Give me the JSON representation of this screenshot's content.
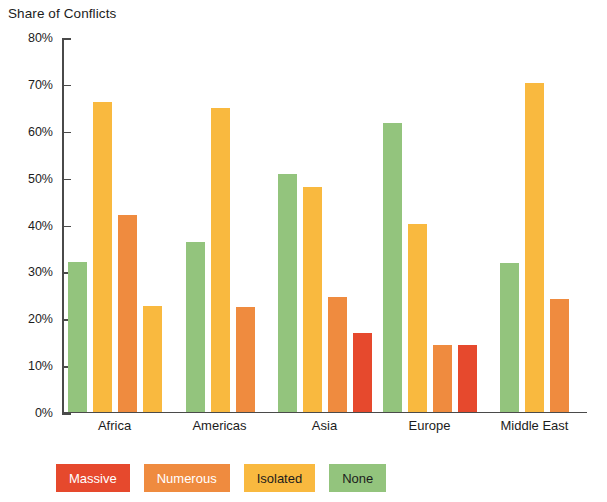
{
  "chart_data": {
    "type": "bar",
    "title": "Share of Conflicts",
    "xlabel": "",
    "ylabel": "",
    "ylim": [
      0,
      80
    ],
    "grid": false,
    "legend_position": "bottom",
    "y_tick_labels": [
      "80%",
      "70%",
      "60%",
      "50%",
      "40%",
      "30%",
      "20%",
      "10%",
      "0%"
    ],
    "y_ticks": [
      80,
      70,
      60,
      50,
      40,
      30,
      20,
      10,
      0
    ],
    "categories": [
      "Africa",
      "Americas",
      "Asia",
      "Europe",
      "Middle East"
    ],
    "series": [
      {
        "name": "None",
        "color": "#93c47d",
        "values": [
          32.0,
          36.2,
          50.6,
          61.5,
          31.7
        ]
      },
      {
        "name": "Isolated",
        "color": "#f9b93f",
        "values": [
          66.1,
          64.8,
          48.0,
          40.0,
          70.0
        ]
      },
      {
        "name": "Numerous",
        "color": "#ef8b3f",
        "values": [
          41.9,
          22.2,
          24.5,
          14.2,
          24.1
        ]
      },
      {
        "name": "Massive",
        "color": "#e6492d",
        "values": [
          22.5,
          null,
          16.8,
          14.2,
          null
        ]
      }
    ],
    "bar_overrides": [
      {
        "category": "Africa",
        "series": "Massive",
        "color": "#f9b93f"
      }
    ],
    "legend": [
      {
        "label": "Massive",
        "color": "#e6492d",
        "text_color": "#ffffff"
      },
      {
        "label": "Numerous",
        "color": "#ef8b3f",
        "text_color": "#ffffff"
      },
      {
        "label": "Isolated",
        "color": "#f9b93f",
        "text_color": "#1c1c1c"
      },
      {
        "label": "None",
        "color": "#93c47d",
        "text_color": "#1c1c1c"
      }
    ],
    "axis_color": "#4a4a4a",
    "background": "#ffffff"
  }
}
